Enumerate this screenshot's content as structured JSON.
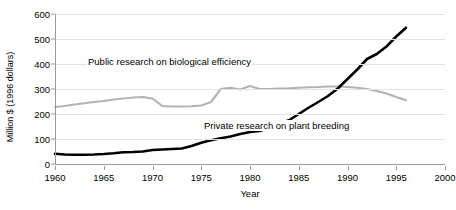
{
  "chart_data": {
    "type": "line",
    "title": "",
    "xlabel": "Year",
    "ylabel": "Million $ (1996 dollars)",
    "xlim": [
      1960,
      2000
    ],
    "ylim": [
      0,
      600
    ],
    "xticks": [
      1960,
      1965,
      1970,
      1975,
      1980,
      1985,
      1990,
      1995,
      2000
    ],
    "yticks": [
      0,
      100,
      200,
      300,
      400,
      500,
      600
    ],
    "grid": true,
    "legend_position": "inline-annotations",
    "series": [
      {
        "name": "Public research on biological efficiency",
        "color": "#b3b3b3",
        "label_x": 1963.5,
        "label_y": 395,
        "x": [
          1960,
          1961,
          1962,
          1963,
          1964,
          1965,
          1966,
          1967,
          1968,
          1969,
          1970,
          1971,
          1972,
          1973,
          1974,
          1975,
          1976,
          1977,
          1978,
          1979,
          1980,
          1981,
          1982,
          1983,
          1984,
          1985,
          1986,
          1987,
          1988,
          1989,
          1990,
          1991,
          1992,
          1993,
          1994,
          1995,
          1996
        ],
        "values": [
          228,
          232,
          238,
          243,
          248,
          252,
          258,
          262,
          266,
          268,
          262,
          232,
          230,
          230,
          231,
          234,
          248,
          300,
          305,
          298,
          312,
          300,
          300,
          302,
          303,
          305,
          307,
          308,
          310,
          310,
          308,
          305,
          300,
          292,
          282,
          268,
          255
        ]
      },
      {
        "name": "Private research on plant breeding",
        "color": "#000000",
        "label_x": 1976,
        "label_y": 150,
        "x": [
          1960,
          1961,
          1962,
          1963,
          1964,
          1965,
          1966,
          1967,
          1968,
          1969,
          1970,
          1971,
          1972,
          1973,
          1974,
          1975,
          1976,
          1977,
          1978,
          1979,
          1980,
          1981,
          1982,
          1983,
          1984,
          1985,
          1986,
          1987,
          1988,
          1989,
          1990,
          1991,
          1992,
          1993,
          1994,
          1995,
          1996
        ],
        "values": [
          41,
          38,
          37,
          37,
          38,
          40,
          43,
          47,
          48,
          50,
          56,
          58,
          60,
          62,
          72,
          85,
          95,
          103,
          110,
          120,
          128,
          132,
          145,
          162,
          175,
          200,
          225,
          248,
          272,
          302,
          340,
          378,
          420,
          440,
          470,
          510,
          545
        ]
      }
    ]
  },
  "axis": {
    "ytick_labels": [
      "0",
      "100",
      "200",
      "300",
      "400",
      "500",
      "600"
    ],
    "xtick_labels": [
      "1960",
      "1965",
      "1970",
      "1975",
      "1980",
      "1985",
      "1990",
      "1995",
      "2000"
    ]
  }
}
